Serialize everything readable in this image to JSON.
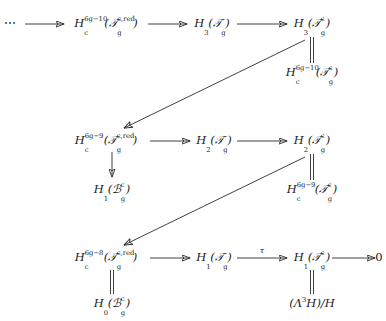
{
  "diagram": {
    "nodes": {
      "r1_dots": "⋯",
      "r1_c1": {
        "base": "H",
        "sub": "c",
        "sup": "6g−10",
        "arg": "(𝒯",
        "arg_sub": "g",
        "arg_sup": "c,red",
        "arg_close": ")"
      },
      "r1_c2": {
        "base": "H",
        "sub": "3",
        "arg": "(𝒯",
        "arg_sub": "g",
        "arg_close": ")"
      },
      "r1_c3": {
        "base": "H",
        "sub": "3",
        "arg": "(𝒯",
        "arg_sub": "g",
        "arg_sup": "c",
        "arg_close": ")"
      },
      "r1_c3_below": {
        "base": "H",
        "sub": "c",
        "sup": "6g−10",
        "arg": "(𝒯",
        "arg_sub": "g",
        "arg_sup": "c",
        "arg_close": ")"
      },
      "r2_c1": {
        "base": "H",
        "sub": "c",
        "sup": "6g−9",
        "arg": "(𝒯",
        "arg_sub": "g",
        "arg_sup": "c,red",
        "arg_close": ")"
      },
      "r2_c2": {
        "base": "H",
        "sub": "2",
        "arg": "(𝒯",
        "arg_sub": "g",
        "arg_close": ")"
      },
      "r2_c3": {
        "base": "H",
        "sub": "2",
        "arg": "(𝒯",
        "arg_sub": "g",
        "arg_sup": "c",
        "arg_close": ")"
      },
      "r2_c1_below": {
        "base": "H",
        "sub": "1",
        "arg": "(ℬ",
        "arg_sub": "g",
        "arg_sup": "c",
        "arg_close": ")"
      },
      "r2_c3_below": {
        "base": "H",
        "sub": "c",
        "sup": "6g−9",
        "arg": "(𝒯",
        "arg_sub": "g",
        "arg_sup": "c",
        "arg_close": ")"
      },
      "r3_c1": {
        "base": "H",
        "sub": "c",
        "sup": "6g−8",
        "arg": "(𝒯",
        "arg_sub": "g",
        "arg_sup": "c,red",
        "arg_close": ")"
      },
      "r3_c2": {
        "base": "H",
        "sub": "1",
        "arg": "(𝒯",
        "arg_sub": "g",
        "arg_close": ")"
      },
      "r3_c3": {
        "base": "H",
        "sub": "1",
        "arg": "(𝒯",
        "arg_sub": "g",
        "arg_sup": "c",
        "arg_close": ")"
      },
      "r3_c4": "0",
      "r3_c1_below": {
        "base": "H",
        "sub": "0",
        "arg": "(ℬ",
        "arg_sub": "g",
        "arg_sup": "c",
        "arg_close": ")"
      },
      "r3_c3_below": {
        "text": "(Λ",
        "sup": "3",
        "mid": "H)/H"
      }
    },
    "arrow_labels": {
      "tau": "τ"
    },
    "colors": {
      "stroke": "#2b2b2b",
      "text": "#1a1a1a",
      "background": "#ffffff"
    }
  }
}
